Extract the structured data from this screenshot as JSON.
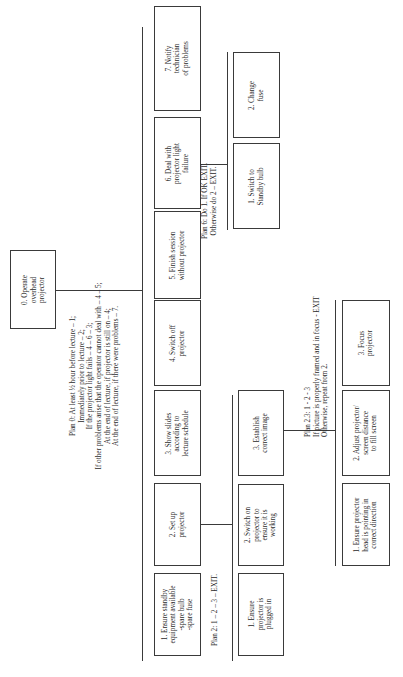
{
  "diagram": {
    "orientation": "rotated 90 degrees clockwise (text reads bottom to top)",
    "root": {
      "label": "0.   Operate\noverhead\nprojector"
    },
    "plan0": {
      "lines": [
        "Plan 0:  At least ½ hour before lecture – 1;",
        "Immediately prior to lecture – 2;",
        "If the projector light fails – 4 – 6 – 3;",
        "If other problems arise that the operator cannot deal with – 4 – 5;",
        "At the end of lecture, if projector is still on – 4;",
        "At the end of lecture, if there were problems – 7."
      ]
    },
    "level1": [
      {
        "id": "1",
        "label": "1.   Ensure standby\nequipment available\n-spare bulb\n-spare fuse"
      },
      {
        "id": "2",
        "label": "2.   Set up\nprojector"
      },
      {
        "id": "3",
        "label": "3.   Show slides\naccording to\nlecture schedule"
      },
      {
        "id": "4",
        "label": "4.   Switch off\nprojector"
      },
      {
        "id": "5",
        "label": "5.   Finish session\nwithout projector"
      },
      {
        "id": "6",
        "label": "6.   Deal with\nprojector light\nfailure"
      },
      {
        "id": "7",
        "label": "7.   Notify\ntechnician\nof problems"
      }
    ],
    "plan2": {
      "text": "Plan 2:  1  –  2  –  3  –  EXIT."
    },
    "level2_task2": [
      {
        "id": "2.1",
        "label": "1.   Ensure\nprojector is\nplugged in"
      },
      {
        "id": "2.2",
        "label": "2.   Switch on\nprojector to\nensure it is\nworking"
      },
      {
        "id": "2.3",
        "label": "3.   Establish\ncorrect image"
      }
    ],
    "plan23": {
      "lines": [
        "Plan 2.3:  1  -  2  -  3",
        "If picture is properly framed and in focus  -  EXIT",
        "Otherwise, repeat from 2."
      ]
    },
    "level3_task23": [
      {
        "id": "2.3.1",
        "label": "1.   Ensure projector\nhead is pointing in\ncorrect direction"
      },
      {
        "id": "2.3.2",
        "label": "2.  Adjust projector/\nscreen distance\nto fill screen"
      },
      {
        "id": "2.3.3",
        "label": "3.   Focus\nprojector"
      }
    ],
    "plan6": {
      "lines": [
        "Plan 6:  Do 1.  If OK EXIT.",
        "Otherwise do 2 –  EXIT."
      ]
    },
    "level2_task6": [
      {
        "id": "6.1",
        "label": "1.   Switch to\nStandby bulb"
      },
      {
        "id": "6.2",
        "label": "2.   Change\nfuse"
      }
    ]
  }
}
